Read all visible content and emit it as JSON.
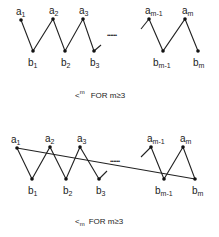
{
  "diagrams": [
    {
      "id": "top",
      "labels": {
        "a1": "a",
        "a1_sub": "1",
        "a2": "a",
        "a2_sub": "2",
        "a3": "a",
        "a3_sub": "3",
        "am1": "a",
        "am1_sub": "m-1",
        "am": "a",
        "am_sub": "m",
        "b1": "b",
        "b1_sub": "1",
        "b2": "b",
        "b2_sub": "2",
        "b3": "b",
        "b3_sub": "3",
        "bm1": "b",
        "bm1_sub": "m-1",
        "bm": "b",
        "bm_sub": "m"
      },
      "ellipsis": "••••••",
      "caption": {
        "symbol": "<",
        "symbol_sup": "m",
        "text": "FOR m≥3"
      }
    },
    {
      "id": "bottom",
      "labels": {
        "a1": "a",
        "a1_sub": "1",
        "a2": "a",
        "a2_sub": "2",
        "a3": "a",
        "a3_sub": "3",
        "am1": "a",
        "am1_sub": "m-1",
        "am": "a",
        "am_sub": "m",
        "b1": "b",
        "b1_sub": "1",
        "b2": "b",
        "b2_sub": "2",
        "b3": "b",
        "b3_sub": "3",
        "bm1": "b",
        "bm1_sub": "m-1",
        "bm": "b",
        "bm_sub": "m"
      },
      "ellipsis": "••••••",
      "caption": {
        "symbol": "<",
        "symbol_sub": "m",
        "text": "FOR m≥3"
      }
    }
  ]
}
